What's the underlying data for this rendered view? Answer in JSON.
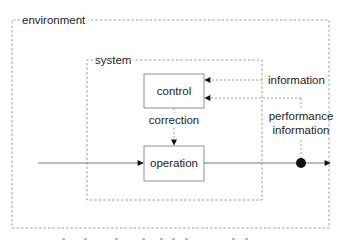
{
  "diagram": {
    "containers": {
      "environment": {
        "label": "environment"
      },
      "system": {
        "label": "system"
      }
    },
    "nodes": {
      "control": {
        "label": "control"
      },
      "operation": {
        "label": "operation"
      }
    },
    "edges": {
      "correction": {
        "label": "correction",
        "from": "control",
        "to": "operation",
        "style": "dashed"
      },
      "information": {
        "label": "information",
        "from": "environment",
        "to": "control",
        "style": "dashed"
      },
      "performance_information": {
        "label_line1": "performance",
        "label_line2": "information",
        "from": "output",
        "to": "control",
        "style": "dashed"
      },
      "input": {
        "to": "operation",
        "style": "solid"
      },
      "output": {
        "from": "operation",
        "style": "solid"
      }
    },
    "colors": {
      "stroke": "#555555",
      "dashed": "#888888",
      "text": "#222222"
    }
  }
}
